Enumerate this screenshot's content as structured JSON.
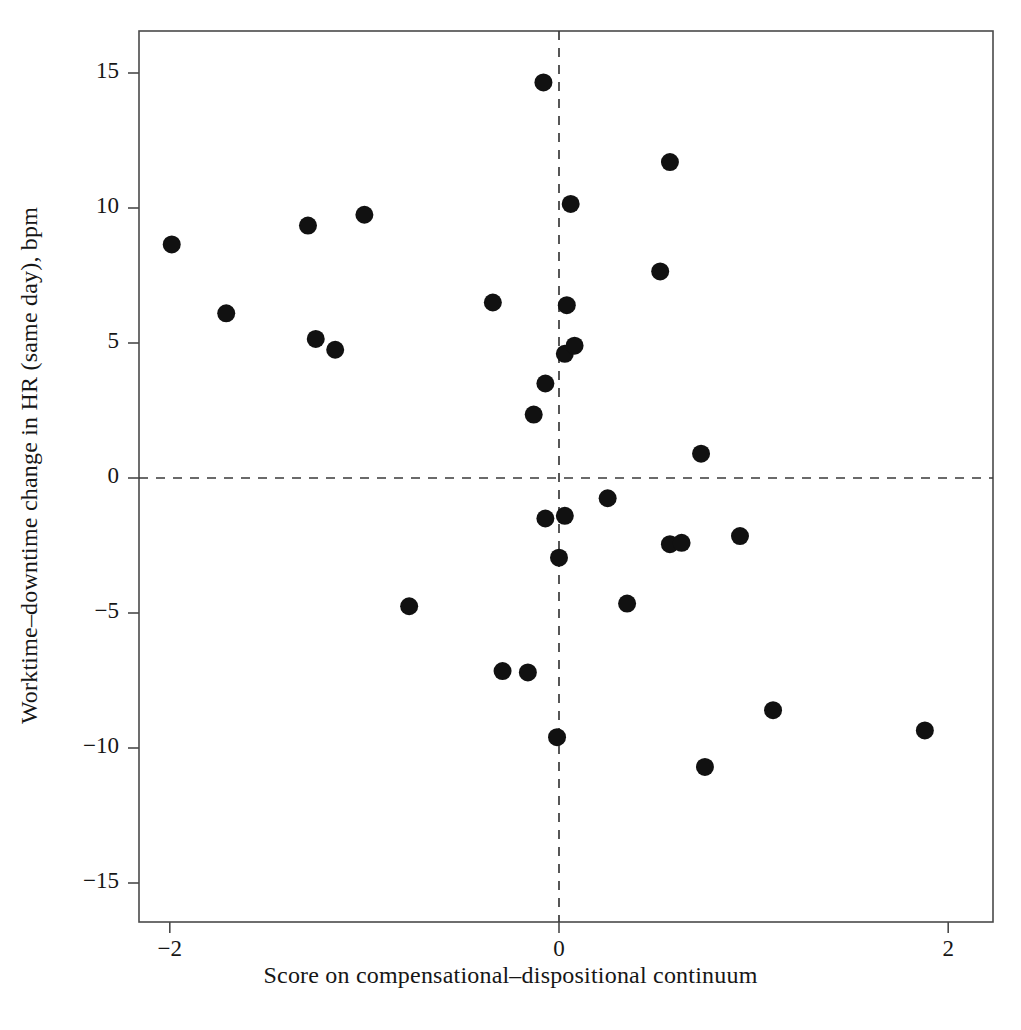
{
  "chart_data": {
    "type": "scatter",
    "title": "",
    "xlabel": "Score on compensational–dispositional continuum",
    "ylabel": "Worktime–downtime change in HR (same day), bpm",
    "xlim": [
      -2.22,
      2.22
    ],
    "ylim": [
      -16.5,
      16.5
    ],
    "xticks": [
      -2,
      0,
      2
    ],
    "xticklabels": [
      "−2",
      "0",
      "2"
    ],
    "yticks": [
      15,
      10,
      5,
      0,
      -5,
      -10,
      -15
    ],
    "yticklabels": [
      "15",
      "10",
      "5",
      "0",
      "−5",
      "−10",
      "−15"
    ],
    "grid": false,
    "legend": null,
    "reference_lines": [
      {
        "orientation": "horizontal",
        "value": 0,
        "style": "dashed"
      },
      {
        "orientation": "vertical",
        "value": 0,
        "style": "dashed"
      }
    ],
    "marker": {
      "shape": "circle",
      "color": "#111111",
      "size": 13
    },
    "series": [
      {
        "name": "participants",
        "points": [
          {
            "x": -1.99,
            "y": 8.65
          },
          {
            "x": -1.71,
            "y": 6.1
          },
          {
            "x": -1.29,
            "y": 9.35
          },
          {
            "x": -1.25,
            "y": 5.15
          },
          {
            "x": -1.15,
            "y": 4.75
          },
          {
            "x": -1.0,
            "y": 9.75
          },
          {
            "x": -0.77,
            "y": -4.75
          },
          {
            "x": -0.34,
            "y": 6.5
          },
          {
            "x": -0.29,
            "y": -7.15
          },
          {
            "x": -0.16,
            "y": -7.2
          },
          {
            "x": -0.13,
            "y": 2.35
          },
          {
            "x": -0.08,
            "y": 14.65
          },
          {
            "x": -0.07,
            "y": 3.5
          },
          {
            "x": -0.07,
            "y": -1.5
          },
          {
            "x": -0.01,
            "y": -9.6
          },
          {
            "x": 0.0,
            "y": -2.95
          },
          {
            "x": 0.03,
            "y": 4.6
          },
          {
            "x": 0.03,
            "y": -1.4
          },
          {
            "x": 0.04,
            "y": 6.4
          },
          {
            "x": 0.06,
            "y": 10.15
          },
          {
            "x": 0.08,
            "y": 4.9
          },
          {
            "x": 0.25,
            "y": -0.75
          },
          {
            "x": 0.35,
            "y": -4.65
          },
          {
            "x": 0.52,
            "y": 7.65
          },
          {
            "x": 0.57,
            "y": -2.45
          },
          {
            "x": 0.57,
            "y": 11.7
          },
          {
            "x": 0.63,
            "y": -2.4
          },
          {
            "x": 0.73,
            "y": 0.9
          },
          {
            "x": 0.75,
            "y": -10.7
          },
          {
            "x": 0.93,
            "y": -2.15
          },
          {
            "x": 1.1,
            "y": -8.6
          },
          {
            "x": 1.88,
            "y": -9.35
          }
        ]
      }
    ]
  },
  "colors": {
    "marker": "#111111",
    "axis": "#4a4a4a",
    "dashed_line": "#3a3a3a",
    "text": "#161616",
    "background": "#ffffff"
  }
}
